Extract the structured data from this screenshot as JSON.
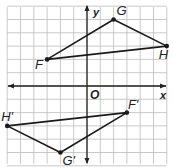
{
  "diagram": {
    "type": "coordinate-grid-reflection",
    "grid": {
      "xmin": -6,
      "xmax": 6,
      "ymin": -6,
      "ymax": 6,
      "unit_px": 13.3
    },
    "axes": {
      "x_label": "x",
      "y_label": "y",
      "origin_label": "O"
    },
    "colors": {
      "grid": "#bbbbbb",
      "axis": "#222222",
      "figure": "#1a1a1a",
      "background": "#ffffff"
    },
    "triangle_original": {
      "vertices": [
        {
          "label": "F",
          "x": -3,
          "y": 2
        },
        {
          "label": "G",
          "x": 2,
          "y": 5
        },
        {
          "label": "H",
          "x": 6,
          "y": 3
        }
      ]
    },
    "triangle_image": {
      "vertices": [
        {
          "label": "F'",
          "x": 3,
          "y": -2
        },
        {
          "label": "G'",
          "x": -2,
          "y": -5
        },
        {
          "label": "H'",
          "x": -6,
          "y": -3
        }
      ]
    }
  }
}
